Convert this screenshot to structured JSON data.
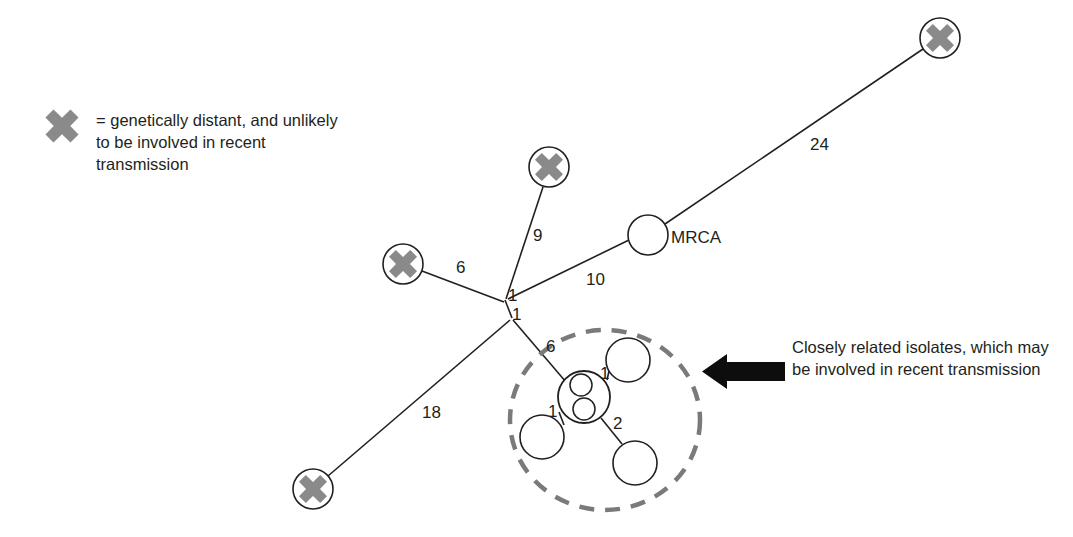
{
  "figure": {
    "type": "phylogenetic-network-diagram",
    "background_color": "#ffffff",
    "line_color": "#231f20",
    "marker_gray": "#8a8a8a",
    "dashed_ellipse_color": "#7a7a7a",
    "arrow_color": "#0d0d0d"
  },
  "legend": {
    "marker_icon": "gray-x-icon",
    "text": "= genetically distant, and unlikely to be involved in recent transmission"
  },
  "callout": {
    "arrow_icon": "left-arrow-icon",
    "text": "Closely related isolates, which may be involved in recent transmission"
  },
  "nodes": {
    "mrca": {
      "label": "MRCA",
      "shape": "open-circle",
      "cx": 648,
      "cy": 235,
      "r": 20
    },
    "distant": [
      {
        "name": "distant-node-top-right",
        "cx": 940,
        "cy": 38,
        "r": 20
      },
      {
        "name": "distant-node-top-middle",
        "cx": 549,
        "cy": 167,
        "r": 20
      },
      {
        "name": "distant-node-left",
        "cx": 403,
        "cy": 264,
        "r": 20
      },
      {
        "name": "distant-node-bottom-left",
        "cx": 313,
        "cy": 489,
        "r": 20
      }
    ],
    "junctions": [
      {
        "name": "junction-upper",
        "cx": 505,
        "cy": 300
      },
      {
        "name": "junction-lower",
        "cx": 512,
        "cy": 318
      }
    ],
    "cluster_hub": {
      "name": "cluster-hub-node",
      "cx": 584,
      "cy": 397,
      "r": 26,
      "inner_circles": [
        {
          "cx": 581,
          "cy": 385,
          "r": 11
        },
        {
          "cx": 584,
          "cy": 409,
          "r": 11
        }
      ]
    },
    "cluster_satellites": [
      {
        "name": "cluster-node-upper-right",
        "cx": 628,
        "cy": 360,
        "r": 22
      },
      {
        "name": "cluster-node-lower-left",
        "cx": 542,
        "cy": 437,
        "r": 22
      },
      {
        "name": "cluster-node-lower-right",
        "cx": 635,
        "cy": 463,
        "r": 22
      }
    ]
  },
  "edge_labels": {
    "mrca_to_top_right": "24",
    "top_middle_branch": "9",
    "left_branch": "6",
    "mrca_to_junction": "10",
    "junction_upper": "1",
    "junction_lower": "1",
    "bottom_left_branch": "18",
    "junction_to_cluster": "6",
    "hub_to_upper_right": "1",
    "hub_to_lower_left": "1",
    "hub_to_lower_right": "2"
  },
  "cluster_highlight": {
    "name": "dashed-ellipse-highlight",
    "cx": 605,
    "cy": 420,
    "rx": 95,
    "ry": 90
  }
}
